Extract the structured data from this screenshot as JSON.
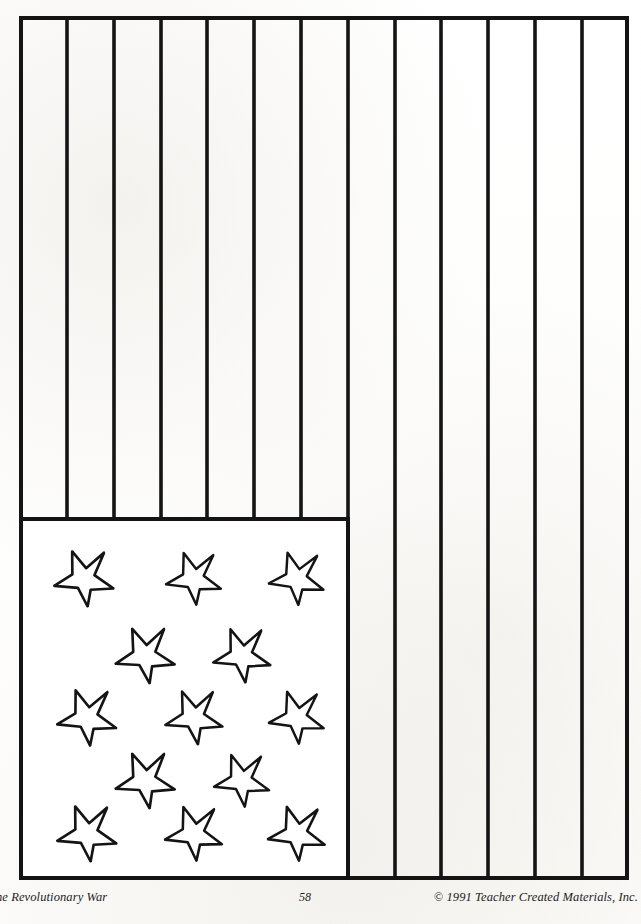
{
  "page": {
    "background_color": "#ffffff",
    "ink_color": "#141414"
  },
  "worksheet": {
    "title": "American Flag Coloring Page",
    "figure_name": "flag-outline",
    "flag": {
      "stripe_count": 13,
      "canton": {
        "label": "star-field-canton",
        "star_count": 13,
        "star_rows": [
          3,
          2,
          3,
          2,
          3
        ]
      },
      "stars": [
        {
          "id": "star-1",
          "row": 1,
          "cx": 63,
          "cy": 562,
          "r": 30,
          "rot": -18
        },
        {
          "id": "star-2",
          "row": 1,
          "cx": 173,
          "cy": 562,
          "r": 28,
          "rot": -16
        },
        {
          "id": "star-3",
          "row": 1,
          "cx": 276,
          "cy": 562,
          "r": 28,
          "rot": -14
        },
        {
          "id": "star-4",
          "row": 2,
          "cx": 124,
          "cy": 639,
          "r": 30,
          "rot": -20
        },
        {
          "id": "star-5",
          "row": 2,
          "cx": 221,
          "cy": 639,
          "r": 29,
          "rot": -18
        },
        {
          "id": "star-6",
          "row": 3,
          "cx": 66,
          "cy": 701,
          "r": 30,
          "rot": -17
        },
        {
          "id": "star-7",
          "row": 3,
          "cx": 173,
          "cy": 701,
          "r": 29,
          "rot": -19
        },
        {
          "id": "star-8",
          "row": 3,
          "cx": 276,
          "cy": 701,
          "r": 28,
          "rot": -15
        },
        {
          "id": "star-9",
          "row": 4,
          "cx": 124,
          "cy": 764,
          "r": 30,
          "rot": -20
        },
        {
          "id": "star-10",
          "row": 4,
          "cx": 221,
          "cy": 764,
          "r": 28,
          "rot": -17
        },
        {
          "id": "star-11",
          "row": 5,
          "cx": 66,
          "cy": 817,
          "r": 30,
          "rot": -18
        },
        {
          "id": "star-12",
          "row": 5,
          "cx": 173,
          "cy": 817,
          "r": 29,
          "rot": -16
        },
        {
          "id": "star-13",
          "row": 5,
          "cx": 276,
          "cy": 817,
          "r": 29,
          "rot": -15
        }
      ]
    }
  },
  "footer": {
    "left_text": "he Revolutionary War",
    "page_number": "58",
    "copyright_mark": "©",
    "copyright_text": "1991 Teacher Created Materials, Inc."
  }
}
